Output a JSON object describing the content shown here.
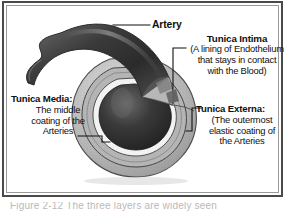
{
  "figure": {
    "style": "grayscale medical illustration",
    "frame_color": "#4a4a4a",
    "inner_frame_color": "#9a9a9a",
    "background": "#ffffff",
    "text_color": "#101010"
  },
  "labels": {
    "artery": {
      "title": "Artery"
    },
    "tunica_intima": {
      "title": "Tunica Intima",
      "line1": "(A lining of Endothelium",
      "line2": "that stays in contact",
      "line3": "with the Blood)"
    },
    "tunica_externa": {
      "title": "Tunica Externa:",
      "line1": "(The outermost",
      "line2": "elastic coating of",
      "line3": "the Arteries"
    },
    "tunica_media": {
      "title": "Tunica Media:",
      "line1": "The middle",
      "line2": "coating of the",
      "line3": "Arteries"
    }
  },
  "caption": {
    "clipped_text": "Figure 2-12  The three layers are widely seen"
  },
  "illustration_colors": {
    "lumen_dark": "#2c2c2c",
    "lumen_mid": "#4e4e4e",
    "intima_light": "#efefef",
    "media_gray": "#9c9c9c",
    "externa_gray": "#bdbdbd",
    "vessel_outline": "#3a3a3a"
  }
}
